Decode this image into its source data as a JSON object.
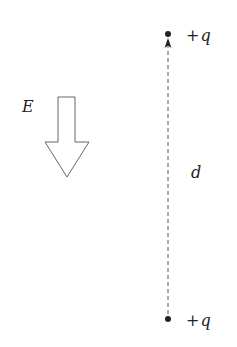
{
  "diagram": {
    "field": {
      "label": "E",
      "direction": "down"
    },
    "charges": [
      {
        "sign": "+",
        "symbol": "q",
        "position": "top"
      },
      {
        "sign": "+",
        "symbol": "q",
        "position": "bottom"
      }
    ],
    "separation": {
      "label": "d",
      "style": "dashed",
      "arrow": "up"
    },
    "colors": {
      "stroke": "#555555",
      "dot": "#222222",
      "text": "#222222",
      "background": "#ffffff"
    }
  }
}
